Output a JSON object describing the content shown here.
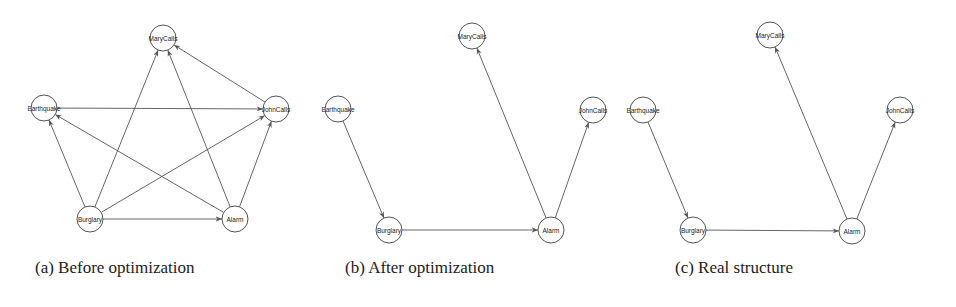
{
  "figure": {
    "panels": [
      {
        "id": "a",
        "caption": "(a) Before optimization",
        "caption_x": 35,
        "nodes": [
          {
            "id": "MaryCalls",
            "label": "MaryCalls",
            "x": 163,
            "y": 38
          },
          {
            "id": "Earthquake",
            "label": "Earthquake",
            "x": 44,
            "y": 108
          },
          {
            "id": "JohnCalls",
            "label": "JohnCalls",
            "x": 276,
            "y": 109
          },
          {
            "id": "Burglary",
            "label": "Burglary",
            "x": 90,
            "y": 219
          },
          {
            "id": "Alarm",
            "label": "Alarm",
            "x": 235,
            "y": 219
          }
        ],
        "edges": [
          {
            "from": "Earthquake",
            "to": "JohnCalls"
          },
          {
            "from": "Burglary",
            "to": "Earthquake"
          },
          {
            "from": "Burglary",
            "to": "MaryCalls"
          },
          {
            "from": "Burglary",
            "to": "JohnCalls"
          },
          {
            "from": "Burglary",
            "to": "Alarm"
          },
          {
            "from": "Alarm",
            "to": "Earthquake"
          },
          {
            "from": "Alarm",
            "to": "MaryCalls"
          },
          {
            "from": "Alarm",
            "to": "JohnCalls"
          },
          {
            "from": "JohnCalls",
            "to": "MaryCalls"
          }
        ]
      },
      {
        "id": "b",
        "caption": "(b) After optimization",
        "caption_x": 345,
        "nodes": [
          {
            "id": "MaryCalls",
            "label": "MaryCalls",
            "x": 472,
            "y": 36
          },
          {
            "id": "Earthquake",
            "label": "Earthquake",
            "x": 338,
            "y": 109
          },
          {
            "id": "JohnCalls",
            "label": "JohnCalls",
            "x": 593,
            "y": 110
          },
          {
            "id": "Burglary",
            "label": "Burglary",
            "x": 389,
            "y": 230
          },
          {
            "id": "Alarm",
            "label": "Alarm",
            "x": 551,
            "y": 230
          }
        ],
        "edges": [
          {
            "from": "Earthquake",
            "to": "Burglary"
          },
          {
            "from": "Burglary",
            "to": "Alarm"
          },
          {
            "from": "Alarm",
            "to": "MaryCalls"
          },
          {
            "from": "Alarm",
            "to": "JohnCalls"
          }
        ]
      },
      {
        "id": "c",
        "caption": "(c) Real structure",
        "caption_x": 675,
        "nodes": [
          {
            "id": "MaryCalls",
            "label": "MaryCalls",
            "x": 770,
            "y": 35
          },
          {
            "id": "Earthquake",
            "label": "Earthquake",
            "x": 643,
            "y": 110
          },
          {
            "id": "JohnCalls",
            "label": "JohnCalls",
            "x": 900,
            "y": 110
          },
          {
            "id": "Burglary",
            "label": "Burglary",
            "x": 693,
            "y": 230
          },
          {
            "id": "Alarm",
            "label": "Alarm",
            "x": 852,
            "y": 231
          }
        ],
        "edges": [
          {
            "from": "Earthquake",
            "to": "Burglary"
          },
          {
            "from": "Burglary",
            "to": "Alarm"
          },
          {
            "from": "Alarm",
            "to": "MaryCalls"
          },
          {
            "from": "Alarm",
            "to": "JohnCalls"
          }
        ]
      }
    ],
    "node_radius": 13,
    "colors": {
      "stroke": "#555555",
      "text": "#222222",
      "background": "#ffffff"
    }
  }
}
